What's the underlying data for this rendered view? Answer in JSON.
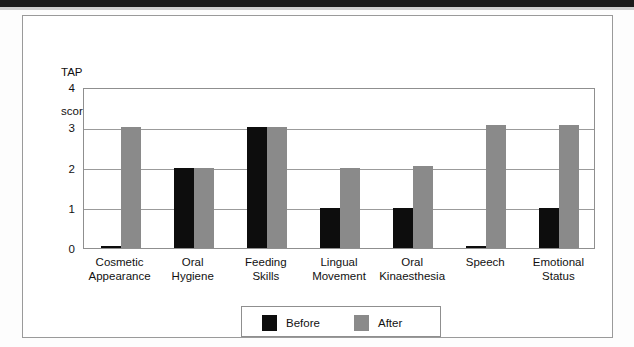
{
  "figure": {
    "axis_title_line1": "TAP",
    "axis_title_line2": "score"
  },
  "legend": {
    "before_label": "Before",
    "after_label": "After"
  },
  "chart_data": {
    "type": "bar",
    "title": "",
    "xlabel": "",
    "ylabel": "TAP score",
    "ylim": [
      0,
      4
    ],
    "yticks": [
      "0",
      "1",
      "2",
      "3",
      "4"
    ],
    "grid": true,
    "legend_position": "bottom-center",
    "categories": [
      "Cosmetic Appearance",
      "Oral Hygiene",
      "Feeding Skills",
      "Lingual Movement",
      "Oral Kinaesthesia",
      "Speech",
      "Emotional Status"
    ],
    "category_lines": [
      [
        "Cosmetic",
        "Appearance"
      ],
      [
        "Oral",
        "Hygiene"
      ],
      [
        "Feeding",
        "Skills"
      ],
      [
        "Lingual",
        "Movement"
      ],
      [
        "Oral",
        "Kinaesthesia"
      ],
      [
        "Speech"
      ],
      [
        "Emotional",
        "Status"
      ]
    ],
    "series": [
      {
        "name": "Before",
        "color": "#0d0d0d",
        "values": [
          0.05,
          2,
          3,
          1,
          1,
          0.05,
          1
        ]
      },
      {
        "name": "After",
        "color": "#8a8a8a",
        "values": [
          3,
          2,
          3,
          2,
          2.05,
          3.05,
          3.05
        ]
      }
    ]
  }
}
